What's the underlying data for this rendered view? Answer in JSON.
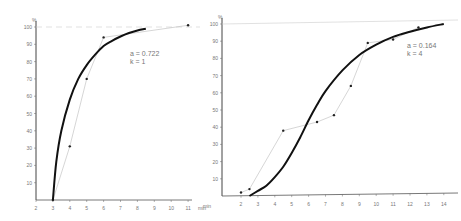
{
  "chart_data": [
    {
      "type": "line",
      "title": "",
      "xlabel": "min",
      "ylabel": "%",
      "xlim": [
        2,
        11
      ],
      "ylim": [
        0,
        100
      ],
      "x_ticks": [
        "2",
        "3",
        "4",
        "5",
        "6",
        "7",
        "8",
        "9",
        "10",
        "11"
      ],
      "y_ticks": [
        "10",
        "20",
        "30",
        "40",
        "50",
        "60",
        "70",
        "80",
        "90",
        "100"
      ],
      "grid": false,
      "annotation": {
        "a_label": "a = 0.722",
        "k_label": "k = 1"
      },
      "series": [
        {
          "name": "observed",
          "style": "thin line with points",
          "x": [
            3,
            4,
            5,
            6,
            11
          ],
          "y": [
            0,
            31,
            70,
            94,
            101
          ]
        },
        {
          "name": "fitted",
          "style": "thick curve",
          "x": [
            3,
            3.2,
            3.5,
            4,
            4.5,
            5,
            5.5,
            6,
            6.5,
            7,
            7.5,
            8,
            8.5
          ],
          "y": [
            0,
            22,
            40,
            58,
            70,
            78,
            84,
            89,
            92,
            94.5,
            96.5,
            98,
            99
          ]
        }
      ]
    },
    {
      "type": "line",
      "title": "",
      "xlabel": "min",
      "ylabel": "%",
      "xlim": [
        1.3,
        14.3
      ],
      "ylim": [
        0,
        100
      ],
      "x_ticks": [
        "2",
        "3",
        "4",
        "5",
        "6",
        "7",
        "8",
        "9",
        "10",
        "11",
        "12",
        "13",
        "14"
      ],
      "y_ticks": [
        "10",
        "20",
        "30",
        "40",
        "50",
        "60",
        "70",
        "80",
        "90",
        "100"
      ],
      "grid": false,
      "annotation": {
        "a_label": "a = 0.164",
        "k_label": "k = 4"
      },
      "series": [
        {
          "name": "observed",
          "style": "thin line with points",
          "x": [
            2,
            2.5,
            4.5,
            6.5,
            7.5,
            8.5,
            9.5,
            11,
            12.5
          ],
          "y": [
            2,
            4,
            38,
            43,
            47,
            64,
            89,
            91,
            98
          ]
        },
        {
          "name": "fitted",
          "style": "thick curve",
          "x": [
            2.5,
            3,
            3.5,
            4,
            4.5,
            5,
            5.5,
            6,
            6.5,
            7,
            8,
            9,
            10,
            11,
            12,
            13,
            14
          ],
          "y": [
            0,
            3,
            6,
            11,
            17,
            25,
            34,
            44,
            53,
            61,
            73,
            82,
            88,
            92.5,
            95.5,
            98,
            100
          ]
        }
      ]
    }
  ],
  "labels": {
    "percent": "%",
    "unit": "min"
  }
}
